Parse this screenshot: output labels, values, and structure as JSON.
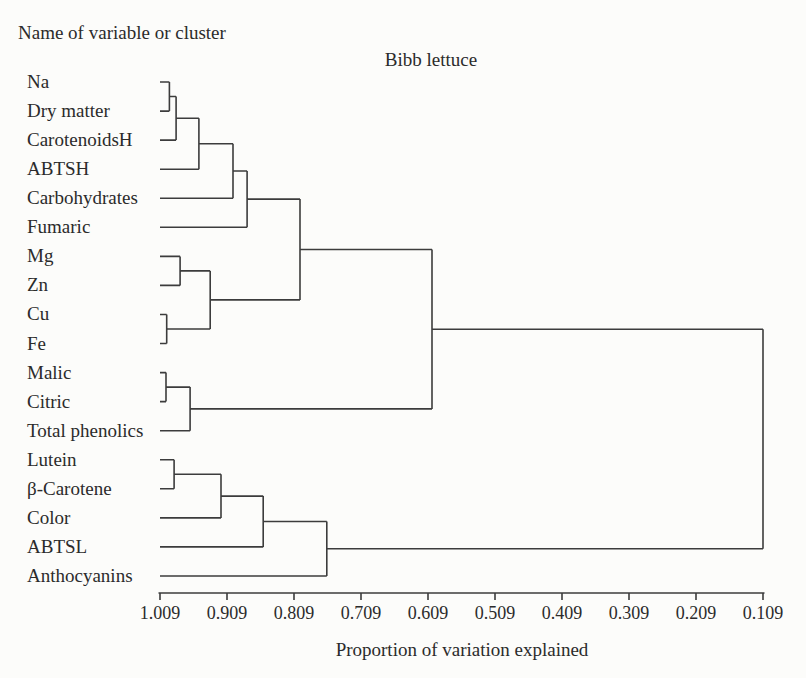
{
  "figure": {
    "header_label": "Name of variable or cluster",
    "colors": {
      "background": "#fcfcfa",
      "text": "#2b2b2b",
      "line": "#3c3c3c"
    }
  },
  "chart_data": {
    "type": "dendrogram",
    "title": "Bibb lettuce",
    "xlabel": "Proportion of variation explained",
    "orientation": "horizontal-right",
    "x_axis": {
      "tick_labels": [
        "1.009",
        "0.909",
        "0.809",
        "0.709",
        "0.609",
        "0.509",
        "0.409",
        "0.309",
        "0.209",
        "0.109"
      ],
      "tick_values": [
        1.009,
        0.909,
        0.809,
        0.709,
        0.609,
        0.509,
        0.409,
        0.309,
        0.209,
        0.109
      ],
      "direction": "decreasing",
      "grid": false
    },
    "leaves": [
      "Na",
      "Dry matter",
      "CarotenoidsH",
      "ABTSH",
      "Carbohydrates",
      "Fumaric",
      "Mg",
      "Zn",
      "Cu",
      "Fe",
      "Malic",
      "Citric",
      "Total phenolics",
      "Lutein",
      "β-Carotene",
      "Color",
      "ABTSL",
      "Anthocyanins"
    ],
    "merges": [
      {
        "children": [
          0,
          1
        ],
        "proportion": 0.995
      },
      {
        "children": [
          18,
          2
        ],
        "proportion": 0.985
      },
      {
        "children": [
          19,
          3
        ],
        "proportion": 0.951
      },
      {
        "children": [
          20,
          4
        ],
        "proportion": 0.9
      },
      {
        "children": [
          21,
          5
        ],
        "proportion": 0.879
      },
      {
        "children": [
          6,
          7
        ],
        "proportion": 0.979
      },
      {
        "children": [
          8,
          9
        ],
        "proportion": 0.999
      },
      {
        "children": [
          23,
          24
        ],
        "proportion": 0.934
      },
      {
        "children": [
          22,
          25
        ],
        "proportion": 0.8
      },
      {
        "children": [
          10,
          11
        ],
        "proportion": 1.0
      },
      {
        "children": [
          27,
          12
        ],
        "proportion": 0.964
      },
      {
        "children": [
          26,
          28
        ],
        "proportion": 0.603
      },
      {
        "children": [
          13,
          14
        ],
        "proportion": 0.988
      },
      {
        "children": [
          30,
          15
        ],
        "proportion": 0.918
      },
      {
        "children": [
          31,
          16
        ],
        "proportion": 0.855
      },
      {
        "children": [
          32,
          17
        ],
        "proportion": 0.76
      },
      {
        "children": [
          29,
          33
        ],
        "proportion": 0.109
      }
    ]
  }
}
